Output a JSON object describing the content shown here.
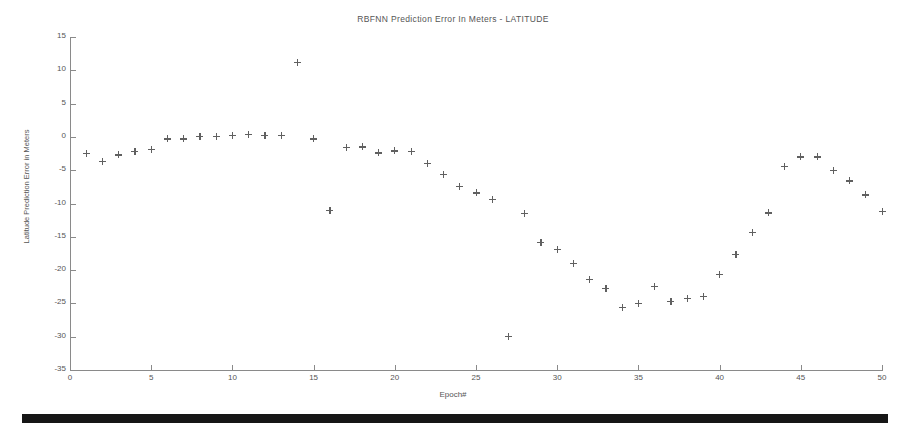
{
  "chart_data": {
    "type": "scatter",
    "title": "RBFNN Prediction Error In Meters - LATITUDE",
    "xlabel": "Epoch#",
    "ylabel": "Latitude Prediction Error in Meters",
    "xlim": [
      0,
      50
    ],
    "ylim": [
      -35,
      15
    ],
    "xticks": [
      0,
      5,
      10,
      15,
      20,
      25,
      30,
      35,
      40,
      45,
      50
    ],
    "yticks": [
      15,
      10,
      5,
      0,
      -5,
      -10,
      -15,
      -20,
      -25,
      -30,
      -35
    ],
    "grid": false,
    "legend": null,
    "marker": "plus",
    "marker_color": "#606060",
    "x": [
      1,
      2,
      3,
      4,
      5,
      6,
      7,
      8,
      9,
      10,
      11,
      12,
      13,
      14,
      15,
      16,
      17,
      18,
      19,
      20,
      21,
      22,
      23,
      24,
      25,
      26,
      27,
      28,
      29,
      30,
      31,
      32,
      33,
      34,
      35,
      36,
      37,
      38,
      39,
      40,
      41,
      42,
      43,
      44,
      45,
      46,
      47,
      48,
      49,
      50
    ],
    "values": [
      -2.5,
      -3.7,
      -2.7,
      -2.2,
      -1.9,
      -0.3,
      -0.3,
      0.1,
      0.1,
      0.2,
      0.4,
      0.2,
      0.2,
      11.2,
      -0.3,
      -11.0,
      -1.6,
      -1.5,
      -2.4,
      -2.1,
      -2.2,
      -4.0,
      -5.6,
      -7.4,
      -8.4,
      -9.4,
      -30.0,
      -11.5,
      -15.9,
      -16.9,
      -19.0,
      -21.4,
      -22.8,
      -25.6,
      -25.0,
      -22.5,
      -24.7,
      -24.2,
      -23.9,
      -20.7,
      -17.6,
      -14.4,
      -11.4,
      -4.4,
      -3.0,
      -3.0,
      -5.0,
      -6.6,
      -8.7,
      -11.2
    ]
  },
  "extras": {
    "last_point_note": "-14.5"
  }
}
